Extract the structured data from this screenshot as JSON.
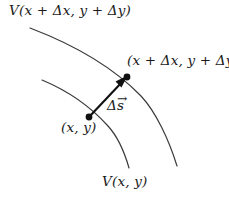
{
  "figure": {
    "background_color": "#ffffff",
    "stroke_color": "#3a3a3a",
    "text_color": "#1a1a1a",
    "width": 229,
    "height": 198
  },
  "labels": {
    "outer_equipotential": "V(x + Δx, y + Δy)",
    "inner_equipotential": "V(x, y)",
    "point_origin": "(x, y)",
    "point_displaced": "(x + Δx, y + Δy)",
    "displacement_delta": "Δ",
    "displacement_symbol": "s",
    "displacement_vector_accent": "→"
  },
  "geometry": {
    "outer_curve_path": "M 30 28 C 72 44 112 66 141 96 C 156 112 169 140 177 166",
    "inner_curve_path": "M 42 80 C 66 90 90 106 108 126 C 119 138 125 154 129 168",
    "vector_start": {
      "x": 89,
      "y": 117
    },
    "vector_end": {
      "x": 127,
      "y": 77
    },
    "dot_radius": 3.4,
    "curve_width": 1.2
  }
}
